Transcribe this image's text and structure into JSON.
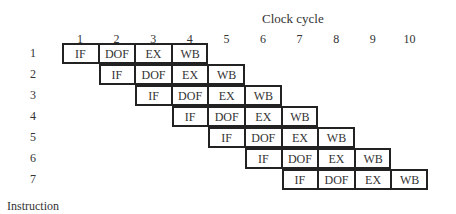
{
  "title": "Clock cycle",
  "y_axis_label": "Instruction",
  "clock_cycles": [
    "1",
    "2",
    "3",
    "4",
    "5",
    "6",
    "7",
    "8",
    "9",
    "10"
  ],
  "instructions": [
    "1",
    "2",
    "3",
    "4",
    "5",
    "6",
    "7"
  ],
  "stages": [
    "IF",
    "DOF",
    "EX",
    "WB"
  ],
  "pipeline": [
    {
      "instruction": "1",
      "start_cycle": 1,
      "stages": [
        "IF",
        "DOF",
        "EX",
        "WB"
      ]
    },
    {
      "instruction": "2",
      "start_cycle": 2,
      "stages": [
        "IF",
        "DOF",
        "EX",
        "WB"
      ]
    },
    {
      "instruction": "3",
      "start_cycle": 3,
      "stages": [
        "IF",
        "DOF",
        "EX",
        "WB"
      ]
    },
    {
      "instruction": "4",
      "start_cycle": 4,
      "stages": [
        "IF",
        "DOF",
        "EX",
        "WB"
      ]
    },
    {
      "instruction": "5",
      "start_cycle": 5,
      "stages": [
        "IF",
        "DOF",
        "EX",
        "WB"
      ]
    },
    {
      "instruction": "6",
      "start_cycle": 6,
      "stages": [
        "IF",
        "DOF",
        "EX",
        "WB"
      ]
    },
    {
      "instruction": "7",
      "start_cycle": 7,
      "stages": [
        "IF",
        "DOF",
        "EX",
        "WB"
      ]
    }
  ]
}
